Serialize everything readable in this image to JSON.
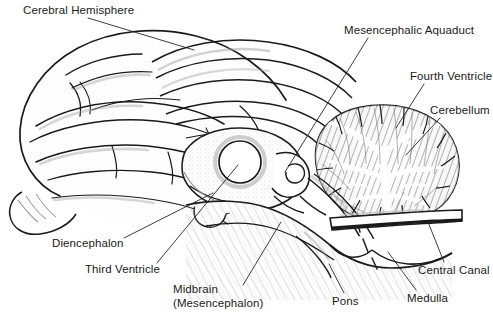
{
  "figure": {
    "type": "anatomical-diagram",
    "width": 493,
    "height": 316,
    "background_color": "#ffffff",
    "ink_color": "#1a1a1a",
    "shading_color": "#8a8a8a"
  },
  "labels": [
    {
      "id": "cerebral-hemisphere",
      "text": "Cerebral Hemisphere",
      "x": 23,
      "y": 4,
      "leader": {
        "x1": 88,
        "y1": 18,
        "x2": 194,
        "y2": 50
      }
    },
    {
      "id": "mesencephalic-aquaduct",
      "text": "Mesencephalic Aquaduct",
      "x": 344,
      "y": 24,
      "leader": {
        "x1": 368,
        "y1": 38,
        "x2": 285,
        "y2": 172
      }
    },
    {
      "id": "fourth-ventricle",
      "text": "Fourth Ventricle",
      "x": 410,
      "y": 70,
      "leader": {
        "x1": 424,
        "y1": 84,
        "x2": 396,
        "y2": 128
      }
    },
    {
      "id": "cerebellum",
      "text": "Cerebellum",
      "x": 430,
      "y": 104,
      "leader": {
        "x1": 440,
        "y1": 118,
        "x2": 406,
        "y2": 155
      }
    },
    {
      "id": "diencephalon",
      "text": "Diencephalon",
      "x": 52,
      "y": 237,
      "leader": {
        "x1": 124,
        "y1": 238,
        "x2": 213,
        "y2": 193
      }
    },
    {
      "id": "third-ventricle",
      "text": "Third Ventricle",
      "x": 85,
      "y": 263,
      "leader": {
        "x1": 157,
        "y1": 263,
        "x2": 238,
        "y2": 165
      }
    },
    {
      "id": "midbrain",
      "text": "Midbrain\n(Mesencephalon)",
      "x": 173,
      "y": 283,
      "leader": {
        "x1": 243,
        "y1": 285,
        "x2": 281,
        "y2": 222
      }
    },
    {
      "id": "pons",
      "text": "Pons",
      "x": 332,
      "y": 295,
      "leader": {
        "x1": 344,
        "y1": 293,
        "x2": 329,
        "y2": 264
      }
    },
    {
      "id": "medulla",
      "text": "Medulla",
      "x": 407,
      "y": 292,
      "leader": {
        "x1": 416,
        "y1": 290,
        "x2": 388,
        "y2": 252
      }
    },
    {
      "id": "central-canal",
      "text": "Central Canal",
      "x": 418,
      "y": 264,
      "leader": {
        "x1": 444,
        "y1": 262,
        "x2": 428,
        "y2": 222
      }
    }
  ],
  "structures": [
    {
      "id": "cerebral-hemisphere-outline",
      "name": "cerebral hemisphere"
    },
    {
      "id": "corpus-callosum",
      "name": "corpus callosum"
    },
    {
      "id": "thalamus-diencephalon",
      "name": "diencephalon / thalamus"
    },
    {
      "id": "third-ventricle-ring",
      "name": "third ventricle"
    },
    {
      "id": "midbrain-region",
      "name": "midbrain (mesencephalon)"
    },
    {
      "id": "cerebellum-arbor-vitae",
      "name": "cerebellum with arbor vitae"
    },
    {
      "id": "fourth-ventricle-space",
      "name": "fourth ventricle"
    },
    {
      "id": "pons-region",
      "name": "pons"
    },
    {
      "id": "medulla-region",
      "name": "medulla oblongata"
    },
    {
      "id": "spinal-cord-stub",
      "name": "spinal cord with central canal"
    },
    {
      "id": "olfactory-bulb",
      "name": "olfactory bulb"
    }
  ]
}
